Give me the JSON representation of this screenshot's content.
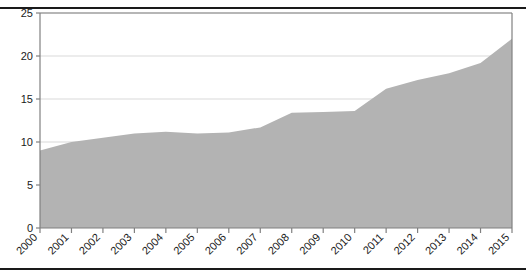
{
  "chart_data": {
    "type": "area",
    "title": "",
    "subtitle": "",
    "xlabel": "",
    "ylabel": "",
    "categories": [
      "2000",
      "2001",
      "2002",
      "2003",
      "2004",
      "2005",
      "2006",
      "2007",
      "2008",
      "2009",
      "2010",
      "2011",
      "2012",
      "2013",
      "2014",
      "2015"
    ],
    "values": [
      9.0,
      10.0,
      10.5,
      11.0,
      11.2,
      11.0,
      11.1,
      11.7,
      13.4,
      13.5,
      13.6,
      16.2,
      17.2,
      18.0,
      19.2,
      22.0
    ],
    "series": [
      {
        "name": "series-1",
        "values": [
          9.0,
          10.0,
          10.5,
          11.0,
          11.2,
          11.0,
          11.1,
          11.7,
          13.4,
          13.5,
          13.6,
          16.2,
          17.2,
          18.0,
          19.2,
          22.0
        ]
      }
    ],
    "ylim": [
      0,
      25
    ],
    "yticks": [
      0,
      5,
      10,
      15,
      20,
      25
    ],
    "ytick_labels": [
      "0",
      "5",
      "10",
      "15",
      "20",
      "25"
    ],
    "xtick_labels": [
      "2000",
      "2001",
      "2002",
      "2003",
      "2004",
      "2005",
      "2006",
      "2007",
      "2008",
      "2009",
      "2010",
      "2011",
      "2012",
      "2013",
      "2014",
      "2015"
    ],
    "xtick_rotation": -45,
    "grid": true,
    "grid_axis": "y",
    "legend": false,
    "legend_position": "none",
    "colors": {
      "area_fill": "#b3b3b3",
      "axis": "#808080",
      "gridline": "#d9d9d9",
      "text": "#1a1a1a",
      "rule": "#1a1a1a",
      "background": "#ffffff"
    }
  }
}
